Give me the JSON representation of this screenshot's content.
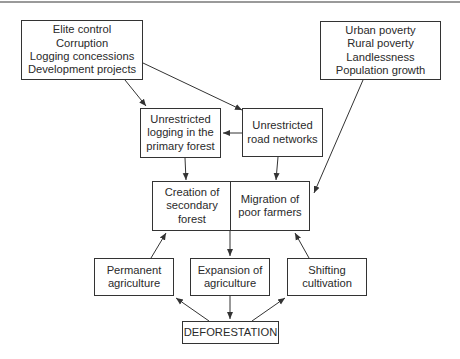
{
  "diagram": {
    "nodes": {
      "governance": {
        "lines": [
          "Elite control",
          "Corruption",
          "Logging concessions",
          "Development projects"
        ]
      },
      "poverty": {
        "lines": [
          "Urban poverty",
          "Rural poverty",
          "Landlessness",
          "Population growth"
        ]
      },
      "logging": {
        "lines": [
          "Unrestricted",
          "logging in the",
          "primary forest"
        ]
      },
      "roads": {
        "lines": [
          "Unrestricted",
          "road networks"
        ]
      },
      "secondary_forest": {
        "lines": [
          "Creation of",
          "secondary",
          "forest"
        ]
      },
      "migration": {
        "lines": [
          "Migration of",
          "poor farmers"
        ]
      },
      "permanent_agriculture": {
        "lines": [
          "Permanent",
          "agriculture"
        ]
      },
      "expansion_agriculture": {
        "lines": [
          "Expansion of",
          "agriculture"
        ]
      },
      "shifting_cultivation": {
        "lines": [
          "Shifting",
          "cultivation"
        ]
      },
      "deforestation": {
        "lines": [
          "DEFORESTATION"
        ]
      }
    },
    "edges": [
      {
        "from": "governance",
        "to": "logging"
      },
      {
        "from": "governance",
        "to": "roads"
      },
      {
        "from": "roads",
        "to": "logging"
      },
      {
        "from": "logging",
        "to": "secondary_forest"
      },
      {
        "from": "roads",
        "to": "migration"
      },
      {
        "from": "poverty",
        "to": "migration"
      },
      {
        "from": "secondary_forest/migration",
        "to": "expansion_agriculture"
      },
      {
        "from": "permanent_agriculture",
        "to": "secondary_forest"
      },
      {
        "from": "shifting_cultivation",
        "to": "migration"
      },
      {
        "from": "deforestation",
        "to": "permanent_agriculture"
      },
      {
        "from": "expansion_agriculture",
        "to": "deforestation"
      },
      {
        "from": "deforestation",
        "to": "shifting_cultivation"
      }
    ],
    "colors": {
      "line": "#333333",
      "text": "#2a2a2a",
      "background": "#ffffff",
      "top_rule": "#9a9a9a"
    }
  }
}
